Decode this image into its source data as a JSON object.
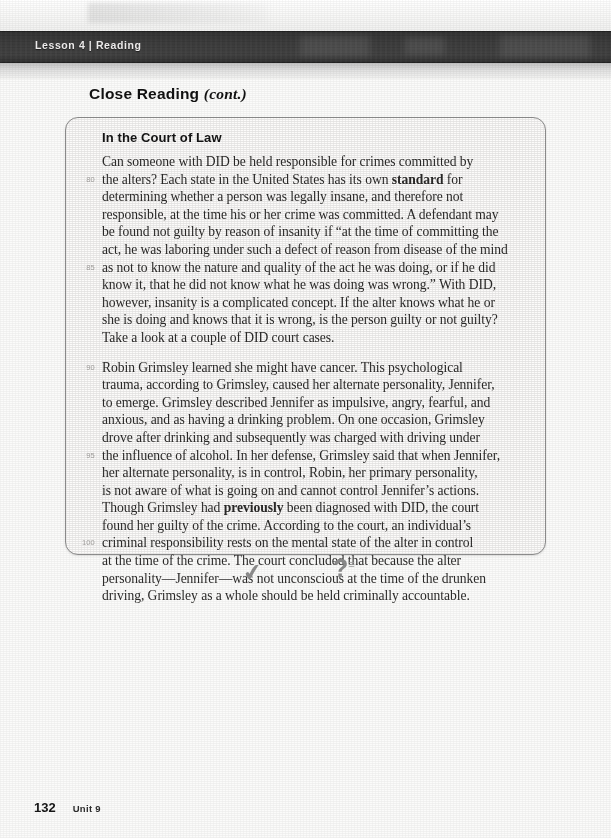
{
  "running_head": {
    "label": "Lesson 4 | Reading"
  },
  "section": {
    "title_main": "Close Reading ",
    "title_cont": "(cont.)"
  },
  "feature_box": {
    "heading": "In the Court of Law",
    "paragraphs": [
      {
        "id": "paragraph-in-the-court-of-law",
        "lines": [
          {
            "num": "",
            "html": "Can someone with DID be held responsible for crimes committed by"
          },
          {
            "num": "80",
            "html": "the alters? Each state in the United States has its own <b>standard</b> for"
          },
          {
            "num": "",
            "html": "determining whether a person was legally insane, and therefore not"
          },
          {
            "num": "",
            "html": "responsible, at the time his or her crime was committed. A defendant may"
          },
          {
            "num": "",
            "html": "be found not guilty by reason of insanity if “at the time of committing the"
          },
          {
            "num": "",
            "html": "act, he was laboring under such a defect of reason from disease of the mind"
          },
          {
            "num": "85",
            "html": "as not to know the nature and quality of the act he was doing, or if he did"
          },
          {
            "num": "",
            "html": "know it, that he did not know what he was doing was wrong.” With DID,"
          },
          {
            "num": "",
            "html": "however, insanity is a complicated concept. If the alter knows what he or"
          },
          {
            "num": "",
            "html": "she is doing and knows that it is wrong, is the person guilty or not guilty?"
          },
          {
            "num": "",
            "html": "Take a look at a couple of DID court cases."
          }
        ]
      },
      {
        "id": "paragraph-robin-grimsley",
        "lines": [
          {
            "num": "90",
            "html": "Robin Grimsley learned she might have cancer. This psychological"
          },
          {
            "num": "",
            "html": "trauma, according to Grimsley, caused her alternate personality, Jennifer,"
          },
          {
            "num": "",
            "html": "to emerge. Grimsley described Jennifer as impulsive, angry, fearful, and"
          },
          {
            "num": "",
            "html": "anxious, and as having a drinking problem. On one occasion, Grimsley"
          },
          {
            "num": "",
            "html": "drove after drinking and subsequently was charged with driving under"
          },
          {
            "num": "95",
            "html": "the influence of alcohol. In her defense, Grimsley said that when Jennifer,"
          },
          {
            "num": "",
            "html": "her alternate personality, is in control, Robin, her primary personality,"
          },
          {
            "num": "",
            "html": "is not aware of what is going on and cannot control Jennifer’s actions."
          },
          {
            "num": "",
            "html": "Though Grimsley had <b>previously</b> been diagnosed with DID, the court"
          },
          {
            "num": "",
            "html": "found her guilty of the crime. According to the court, an individual’s"
          },
          {
            "num": "100",
            "html": "criminal responsibility rests on the mental state of the alter in control"
          },
          {
            "num": "",
            "html": "at the time of the crime. The court concluded that because the alter"
          },
          {
            "num": "",
            "html": "personality—Jennifer—was not unconscious at the time of the drunken"
          },
          {
            "num": "",
            "html": "driving, Grimsley as a whole should be held criminally accountable."
          }
        ]
      }
    ]
  },
  "annotations": {
    "check_glyph": "✔",
    "question_glyph": "?",
    "question_tick": "≡"
  },
  "footer": {
    "page_number": "132",
    "unit_label": "Unit 9"
  },
  "colors": {
    "running_head_bg": "#3a3a3a",
    "running_head_text": "#eceaea",
    "box_border": "#8d8d8d",
    "body_text": "#2b2a29",
    "line_number": "#a9a7a5",
    "annotation": "#8e8e8e",
    "paper": "#fbfbfa"
  }
}
